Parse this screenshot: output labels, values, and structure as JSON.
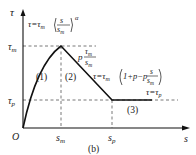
{
  "figure": {
    "caption": "(b)",
    "axes": {
      "y_label": "τ",
      "x_label": "s",
      "origin_label": "O",
      "y_ticks": [
        "τm",
        "τp"
      ],
      "x_ticks": [
        "sm",
        "sp"
      ]
    },
    "labels": {
      "tau": "τ",
      "s": "s",
      "origin": "O",
      "tau_m": "τ",
      "tau_m_sub": "m",
      "tau_p": "τ",
      "tau_p_sub": "p",
      "s_m": "s",
      "s_m_sub": "m",
      "s_p": "s",
      "s_p_sub": "p"
    },
    "segments": [
      {
        "id": "1",
        "label": "(1)",
        "equation": "τ=τm(s/sm)^α"
      },
      {
        "id": "2",
        "label": "(2)",
        "equation": "τ=τm(1+p−p·s/sm)",
        "slope_label": "p·τm/sm"
      },
      {
        "id": "3",
        "label": "(3)",
        "equation": "τ=τp"
      }
    ],
    "equations": {
      "eq1_lhs": "τ=τ",
      "eq1_sub": "m",
      "eq1_exp": "α",
      "eq1_num": "s",
      "eq1_den": "s",
      "eq1_den_sub": "m",
      "slope_p": "p",
      "slope_num": "τ",
      "slope_num_sub": "m",
      "slope_den": "s",
      "slope_den_sub": "m",
      "eq2_lhs": "τ=τ",
      "eq2_sub": "m",
      "eq2_mid": "1+p−p",
      "eq2_num": "s",
      "eq2_den": "s",
      "eq2_den_sub": "m",
      "eq3": "τ=τ",
      "eq3_sub": "p"
    },
    "seg_labels": {
      "one": "(1)",
      "two": "(2)",
      "three": "(3)"
    },
    "colors": {
      "curve": "#111111",
      "dashed": "#444444"
    }
  }
}
